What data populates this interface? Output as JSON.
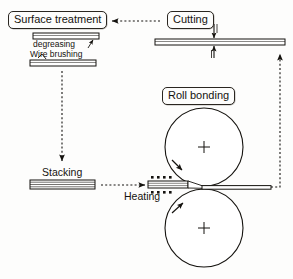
{
  "diagram": {
    "background_color": "#fdfdfc",
    "line_color": "#15130f",
    "nodes": {
      "surface_treatment": {
        "label": "Surface treatment",
        "style": "rounded-box"
      },
      "cutting": {
        "label": "Cutting",
        "style": "rounded-box"
      },
      "roll_bonding": {
        "label": "Roll bonding",
        "style": "rounded-box"
      },
      "stacking": {
        "label": "Stacking",
        "style": "plain-text"
      },
      "heating": {
        "label": "Heating",
        "style": "plain-text"
      }
    },
    "annotations": {
      "degreasing": {
        "label": "degreasing"
      },
      "wire_brushing": {
        "label": "Wire brushing"
      }
    },
    "flow_arrows": [
      {
        "name": "cutting-to-surface-treatment",
        "style": "dotted",
        "direction": "left"
      },
      {
        "name": "surface-treatment-to-stacking",
        "style": "dotted",
        "direction": "down"
      },
      {
        "name": "stacking-to-heating",
        "style": "dotted",
        "direction": "right"
      },
      {
        "name": "bonded-strip-to-cutting",
        "style": "dotted",
        "direction": "up"
      }
    ],
    "rolls": [
      {
        "name": "upper-roll",
        "center_mark": "cross",
        "rotation": "clockwise"
      },
      {
        "name": "lower-roll",
        "center_mark": "cross",
        "rotation": "counter-clockwise"
      }
    ],
    "heater_dots": {
      "top_count": 4,
      "bottom_count": 4
    },
    "cutting_blades": {
      "count": 2,
      "orientation": "vertical-opposed"
    }
  }
}
